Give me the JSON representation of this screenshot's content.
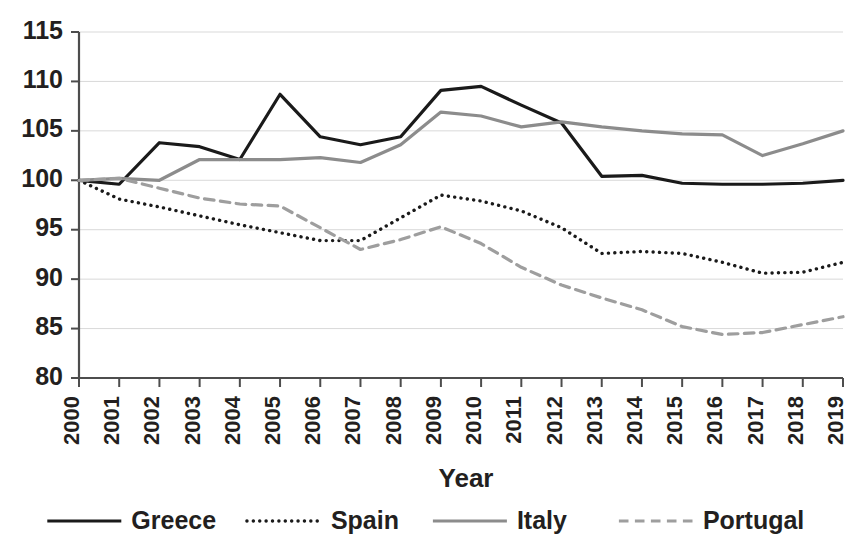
{
  "chart_data": {
    "type": "line",
    "title": "",
    "xlabel": "Year",
    "ylabel": "",
    "x": [
      2000,
      2001,
      2002,
      2003,
      2004,
      2005,
      2006,
      2007,
      2008,
      2009,
      2010,
      2011,
      2012,
      2013,
      2014,
      2015,
      2016,
      2017,
      2018,
      2019
    ],
    "categories": [
      "2000",
      "2001",
      "2002",
      "2003",
      "2004",
      "2005",
      "2006",
      "2007",
      "2008",
      "2009",
      "2010",
      "2011",
      "2012",
      "2013",
      "2014",
      "2015",
      "2016",
      "2017",
      "2018",
      "2019"
    ],
    "ylim": [
      80,
      115
    ],
    "yticks": [
      80,
      85,
      90,
      95,
      100,
      105,
      110,
      115
    ],
    "ytick_labels": [
      "80",
      "85",
      "90",
      "95",
      "100",
      "105",
      "110",
      "115"
    ],
    "grid": true,
    "legend_position": "bottom",
    "series": [
      {
        "name": "Greece",
        "color": "#1a1a1a",
        "dash": "solid",
        "width": 3.2,
        "values": [
          100.0,
          99.6,
          103.8,
          103.4,
          102.1,
          108.7,
          104.4,
          103.6,
          104.4,
          109.1,
          109.5,
          107.6,
          105.8,
          100.4,
          100.5,
          99.7,
          99.6,
          99.6,
          99.7,
          100.0
        ]
      },
      {
        "name": "Spain",
        "color": "#1a1a1a",
        "dash": "dotted",
        "width": 3.4,
        "values": [
          100.0,
          98.1,
          97.3,
          96.4,
          95.5,
          94.7,
          93.9,
          93.9,
          96.2,
          98.5,
          97.9,
          96.9,
          95.2,
          92.6,
          92.8,
          92.6,
          91.7,
          90.6,
          90.7,
          91.7
        ]
      },
      {
        "name": "Italy",
        "color": "#8c8c8c",
        "dash": "solid",
        "width": 3.2,
        "values": [
          100.0,
          100.2,
          100.0,
          102.1,
          102.1,
          102.1,
          102.3,
          101.8,
          103.6,
          106.9,
          106.5,
          105.4,
          105.9,
          105.4,
          105.0,
          104.7,
          104.6,
          102.5,
          103.7,
          105.0
        ]
      },
      {
        "name": "Portugal",
        "color": "#9e9e9e",
        "dash": "dashed",
        "width": 3.2,
        "values": [
          100.0,
          100.2,
          99.2,
          98.2,
          97.6,
          97.4,
          95.2,
          93.0,
          94.0,
          95.3,
          93.6,
          91.2,
          89.4,
          88.1,
          86.9,
          85.2,
          84.4,
          84.6,
          85.4,
          86.2
        ]
      }
    ]
  },
  "axes": {
    "x_title": "Year"
  },
  "legend": {
    "entries": [
      {
        "label": "Greece",
        "style": "solid-black"
      },
      {
        "label": "Spain",
        "style": "dotted-black"
      },
      {
        "label": "Italy",
        "style": "solid-gray"
      },
      {
        "label": "Portugal",
        "style": "dashed-gray"
      }
    ]
  }
}
